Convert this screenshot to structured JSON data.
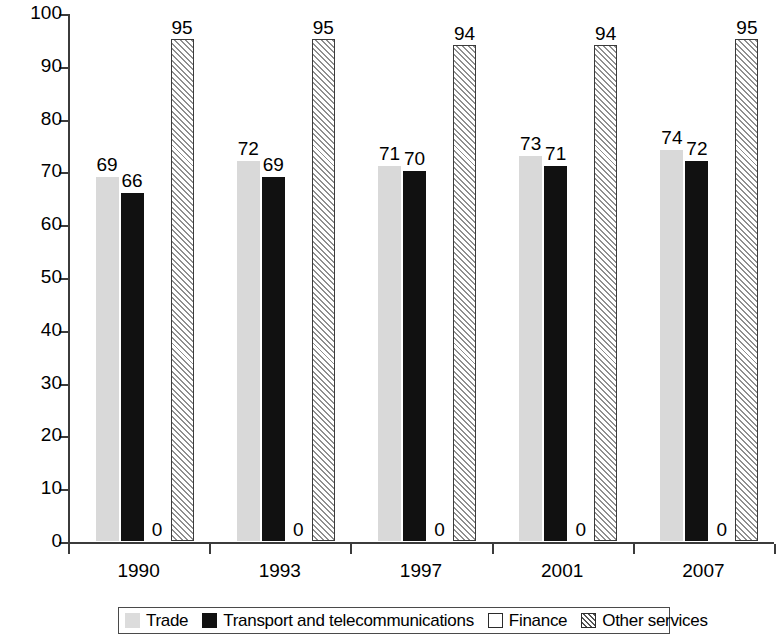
{
  "chart_data": {
    "type": "bar",
    "title": "",
    "subtitle": "",
    "xlabel": "",
    "ylabel": "% of value added",
    "categories": [
      "1990",
      "1993",
      "1997",
      "2001",
      "2007"
    ],
    "series": [
      {
        "name": "Trade",
        "values": [
          69,
          72,
          71,
          73,
          74
        ],
        "swatch": "light-gray-speckled"
      },
      {
        "name": "Transport and telecommunications",
        "values": [
          66,
          69,
          70,
          71,
          72
        ],
        "swatch": "black"
      },
      {
        "name": "Finance",
        "values": [
          0,
          0,
          0,
          0,
          0
        ],
        "swatch": "white-outline"
      },
      {
        "name": "Other services",
        "values": [
          95,
          95,
          94,
          94,
          95
        ],
        "swatch": "diagonal-hatch"
      }
    ],
    "ylim": [
      0,
      100
    ],
    "yticks": [
      0,
      10,
      20,
      30,
      40,
      50,
      60,
      70,
      80,
      90,
      100
    ],
    "ytick_labels": [
      "0",
      "10",
      "20",
      "30",
      "40",
      "50",
      "60",
      "70",
      "80",
      "90",
      "100"
    ],
    "grid": false,
    "data_labels": true,
    "legend_position": "bottom",
    "colors": {
      "trade": "#d9d9d9",
      "transport": "#111111",
      "finance": "#ffffff",
      "other_services": "#ffffff",
      "axis": "#3b3b3b",
      "text": "#000000",
      "background": "#ffffff"
    }
  },
  "legend": {
    "items": [
      {
        "label": "Trade"
      },
      {
        "label": "Transport and telecommunications"
      },
      {
        "label": "Finance"
      },
      {
        "label": "Other services"
      }
    ]
  }
}
